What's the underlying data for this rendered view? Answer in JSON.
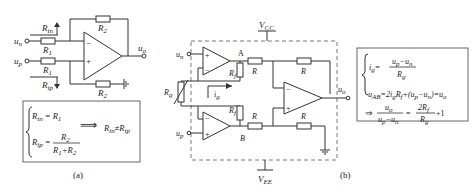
{
  "figure_a": {
    "caption": "(a)",
    "labels": {
      "un": "u",
      "un_sub": "n",
      "up": "u",
      "up_sub": "p",
      "uo": "u",
      "uo_sub": "o",
      "Rin": "R",
      "Rin_sub": "in",
      "Rip": "R",
      "Rip_sub": "ip",
      "R1_top": "R",
      "R1_top_sub": "1",
      "R1_bot": "R",
      "R1_bot_sub": "1",
      "R2_top": "R",
      "R2_top_sub": "2",
      "R2_bot": "R",
      "R2_bot_sub": "2",
      "minus": "−",
      "plus": "+"
    },
    "formula_box": {
      "line1_lhs": "R",
      "line1_lhs_sub": "in",
      "line1_eq": " = ",
      "line1_rhs": "R",
      "line1_rhs_sub": "1",
      "line2_lhs": "R",
      "line2_lhs_sub": "ip",
      "line2_eq": " = ",
      "line2_num": "R",
      "line2_num_sub": "2",
      "line2_den_a": "R",
      "line2_den_a_sub": "1",
      "line2_den_plus": "+",
      "line2_den_b": "R",
      "line2_den_b_sub": "2",
      "implies": "⟹",
      "result_a": "R",
      "result_a_sub": "in",
      "result_neq": "≠",
      "result_b": "R",
      "result_b_sub": "ip"
    }
  },
  "figure_b": {
    "caption": "(b)",
    "labels": {
      "vcc": "V",
      "vcc_sub": "CC",
      "vee": "V",
      "vee_sub": "EE",
      "un": "u",
      "un_sub": "n",
      "up": "u",
      "up_sub": "p",
      "uo": "u",
      "uo_sub": "o",
      "node_a": "A",
      "node_b": "B",
      "rf_top": "R",
      "rf_top_sub": "f",
      "rf_bot": "R",
      "rf_bot_sub": "f",
      "rg": "R",
      "rg_sub": "g",
      "ig": "i",
      "ig_sub": "g",
      "r1": "R",
      "r2": "R",
      "r3": "R",
      "r4": "R",
      "plus": "+",
      "minus": "−"
    },
    "formula_box": {
      "line1_lhs": "i",
      "line1_lhs_sub": "g",
      "line1_eq": "=",
      "line1_num": "u",
      "line1_num_sub_a": "p",
      "line1_num_mid": "−u",
      "line1_num_sub_b": "n",
      "line1_den": "R",
      "line1_den_sub": "g",
      "line2": "u",
      "line2_sub": "AB",
      "line2_rest_1": "=2i",
      "line2_sub2": "g",
      "line2_rest_2": "R",
      "line2_sub3": "f",
      "line2_rest_3": "+(u",
      "line2_sub4": "p",
      "line2_rest_4": "−u",
      "line2_sub5": "n",
      "line2_rest_5": ")=u",
      "line2_sub6": "o",
      "implies": "⇒",
      "line3_num": "u",
      "line3_num_sub": "o",
      "line3_den_a": "u",
      "line3_den_a_sub": "p",
      "line3_den_mid": "−u",
      "line3_den_b_sub": "n",
      "line3_eq": "=",
      "line3_rhs_num": "2R",
      "line3_rhs_num_sub": "f",
      "line3_rhs_den": "R",
      "line3_rhs_den_sub": "g",
      "line3_plus_one": "+1"
    }
  }
}
